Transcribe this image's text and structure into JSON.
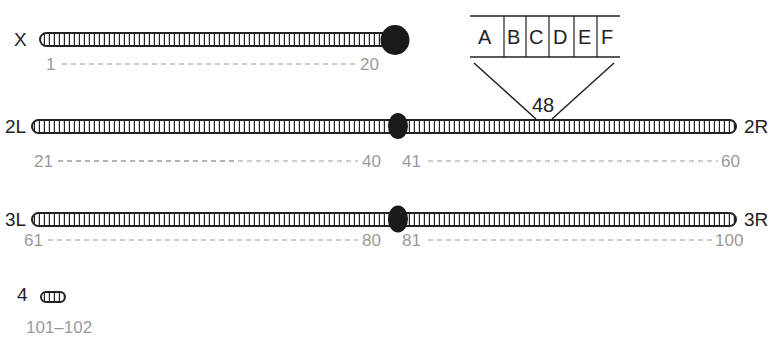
{
  "diagram": {
    "colors": {
      "ink": "#222222",
      "number_gray": "#9a9a9a",
      "centromere": "#1a1a1a",
      "background": "#ffffff"
    },
    "chromosomes": [
      {
        "id": "X",
        "left_label": "X",
        "right_label": "",
        "range_left": [
          "1",
          "20"
        ],
        "range_right": []
      },
      {
        "id": "2",
        "left_label": "2L",
        "right_label": "2R",
        "range_left": [
          "21",
          "40"
        ],
        "range_right": [
          "41",
          "60"
        ]
      },
      {
        "id": "3",
        "left_label": "3L",
        "right_label": "3R",
        "range_left": [
          "61",
          "80"
        ],
        "range_right": [
          "81",
          "100"
        ]
      },
      {
        "id": "4",
        "left_label": "4",
        "right_label": "",
        "range_text": "101–102"
      }
    ],
    "zoom_inset": {
      "division": "48",
      "subdivisions": [
        "A",
        "B",
        "C",
        "D",
        "E",
        "F"
      ]
    }
  }
}
